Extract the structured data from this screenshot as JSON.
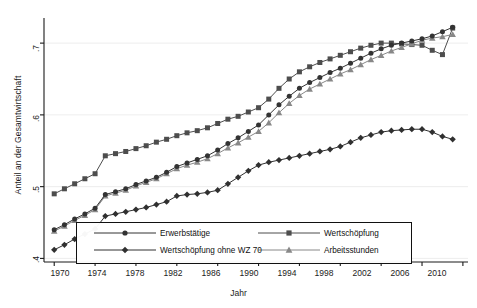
{
  "chart_data": {
    "type": "line",
    "title": "",
    "xlabel": "Jahr",
    "ylabel": "Anteil an der Gesamtwirtschaft",
    "xlim": [
      1969,
      2010.5
    ],
    "ylim": [
      0.395,
      0.735
    ],
    "xticks": [
      1970,
      1974,
      1978,
      1982,
      1986,
      1990,
      1994,
      1998,
      2002,
      2006,
      2010
    ],
    "xtick_labels": [
      "1970",
      "1974",
      "1978",
      "1982",
      "1986",
      "1990",
      "1994",
      "1998",
      "2002",
      "2006",
      "2010"
    ],
    "yticks": [
      0.4,
      0.5,
      0.6,
      0.7
    ],
    "ytick_labels": [
      ".4",
      ".5",
      ".6",
      ".7"
    ],
    "grid": "horizontal-faint",
    "legend_position": "bottom-inside",
    "x": [
      1970,
      1971,
      1972,
      1973,
      1974,
      1975,
      1976,
      1977,
      1978,
      1979,
      1980,
      1981,
      1982,
      1983,
      1984,
      1985,
      1986,
      1987,
      1988,
      1989,
      1990,
      1991,
      1992,
      1993,
      1994,
      1995,
      1996,
      1997,
      1998,
      1999,
      2000,
      2001,
      2002,
      2003,
      2004,
      2005,
      2006,
      2007,
      2008,
      2009
    ],
    "series": [
      {
        "name": "Erwerbstätige",
        "marker": "circle",
        "color": "#333333",
        "values": [
          0.44,
          0.447,
          0.455,
          0.462,
          0.47,
          0.489,
          0.493,
          0.497,
          0.503,
          0.508,
          0.513,
          0.52,
          0.528,
          0.533,
          0.538,
          0.543,
          0.551,
          0.56,
          0.568,
          0.577,
          0.586,
          0.6,
          0.614,
          0.626,
          0.637,
          0.645,
          0.652,
          0.659,
          0.665,
          0.672,
          0.679,
          0.686,
          0.692,
          0.697,
          0.7,
          0.703,
          0.706,
          0.71,
          0.716,
          0.722
        ]
      },
      {
        "name": "Wertschöpfung",
        "marker": "square",
        "color": "#4d4d4d",
        "values": [
          0.49,
          0.497,
          0.504,
          0.511,
          0.518,
          0.543,
          0.546,
          0.549,
          0.553,
          0.557,
          0.562,
          0.566,
          0.571,
          0.575,
          0.578,
          0.582,
          0.588,
          0.594,
          0.598,
          0.604,
          0.61,
          0.622,
          0.637,
          0.65,
          0.66,
          0.667,
          0.673,
          0.678,
          0.683,
          0.688,
          0.693,
          0.697,
          0.7,
          0.7,
          0.699,
          0.698,
          0.697,
          0.69,
          0.684,
          0.721
        ]
      },
      {
        "name": "Wertschöpfung ohne WZ 70",
        "marker": "diamond",
        "color": "#303030",
        "values": [
          0.412,
          0.419,
          0.427,
          0.434,
          0.441,
          0.459,
          0.462,
          0.465,
          0.468,
          0.471,
          0.475,
          0.479,
          0.487,
          0.489,
          0.49,
          0.492,
          0.495,
          0.504,
          0.513,
          0.522,
          0.53,
          0.534,
          0.537,
          0.54,
          0.543,
          0.546,
          0.549,
          0.552,
          0.556,
          0.562,
          0.568,
          0.572,
          0.576,
          0.578,
          0.579,
          0.58,
          0.58,
          0.576,
          0.57,
          0.566
        ]
      },
      {
        "name": "Arbeitsstunden",
        "marker": "triangle",
        "color": "#888888",
        "values": [
          0.438,
          0.445,
          0.453,
          0.46,
          0.468,
          0.487,
          0.491,
          0.495,
          0.501,
          0.506,
          0.511,
          0.518,
          0.525,
          0.53,
          0.534,
          0.539,
          0.546,
          0.554,
          0.561,
          0.569,
          0.577,
          0.589,
          0.603,
          0.616,
          0.627,
          0.636,
          0.643,
          0.65,
          0.657,
          0.663,
          0.67,
          0.677,
          0.683,
          0.689,
          0.694,
          0.699,
          0.704,
          0.707,
          0.709,
          0.712
        ]
      }
    ]
  },
  "axes": {
    "ylabel": "Anteil an der Gesamtwirtschaft",
    "xlabel": "Jahr",
    "ytick_0": ".4",
    "ytick_1": ".5",
    "ytick_2": ".6",
    "ytick_3": ".7",
    "xtick_0": "1970",
    "xtick_1": "1974",
    "xtick_2": "1978",
    "xtick_3": "1982",
    "xtick_4": "1986",
    "xtick_5": "1990",
    "xtick_6": "1994",
    "xtick_7": "1998",
    "xtick_8": "2002",
    "xtick_9": "2006",
    "xtick_10": "2010"
  },
  "legend": {
    "items": [
      {
        "label": "Erwerbstätige",
        "marker": "circle"
      },
      {
        "label": "Wertschöpfung",
        "marker": "square"
      },
      {
        "label": "Wertschöpfung ohne WZ 70",
        "marker": "diamond"
      },
      {
        "label": "Arbeitsstunden",
        "marker": "triangle"
      }
    ]
  },
  "colors": {
    "circle": "#333333",
    "square": "#4d4d4d",
    "diamond": "#303030",
    "triangle": "#888888",
    "axis": "#1a1a1a",
    "grid": "#e8e8e8",
    "background": "#ffffff"
  }
}
